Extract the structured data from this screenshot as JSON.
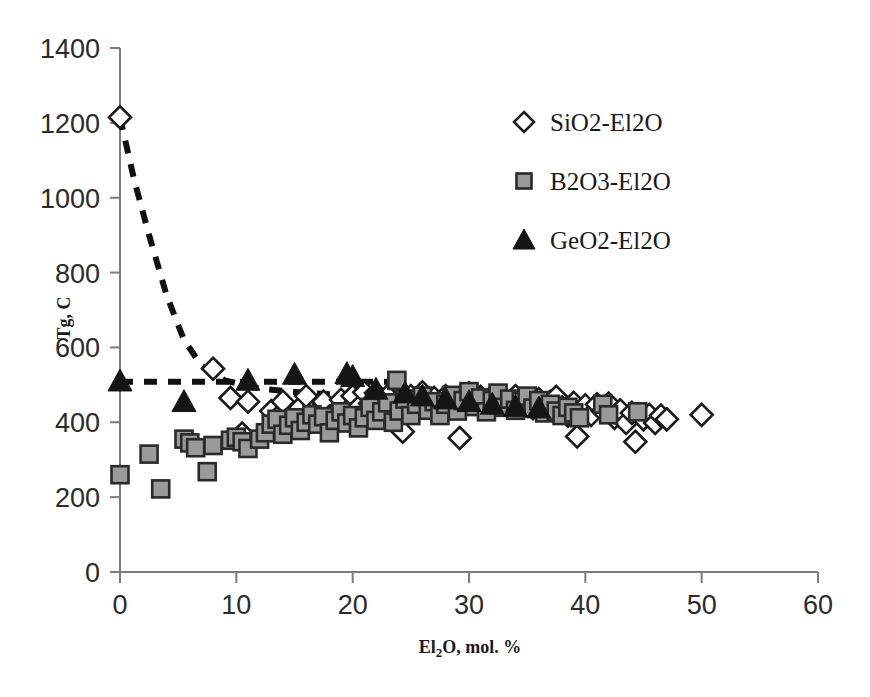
{
  "chart_data": {
    "type": "scatter",
    "title": "",
    "xlabel": "El2O, mol. %",
    "xlabel_parts": {
      "pre": "El",
      "sub": "2",
      "post": "O, mol. %"
    },
    "ylabel": "Tg, C",
    "xlim": [
      0,
      60
    ],
    "ylim": [
      0,
      1400
    ],
    "xticks": [
      "0",
      "10",
      "20",
      "30",
      "40",
      "50",
      "60"
    ],
    "yticks": [
      "0",
      "200",
      "400",
      "600",
      "800",
      "1000",
      "1200",
      "1400"
    ],
    "xtick_step": 10,
    "ytick_step": 200,
    "grid": false,
    "legend_position": "upper-right",
    "colors": {
      "diamond_fill": "#ffffff",
      "diamond_stroke": "#1a1a1a",
      "square_fill": "#9a9a9a",
      "square_stroke": "#2a2a2a",
      "triangle_fill": "#151515",
      "axis": "#7b7b7b",
      "trendline": "#111111",
      "background": "#ffffff"
    },
    "series": [
      {
        "name": "SiO2-El2O",
        "marker": "diamond-open",
        "points": [
          [
            0,
            1215
          ],
          [
            8,
            543
          ],
          [
            9.5,
            465
          ],
          [
            11,
            455
          ],
          [
            10.5,
            370
          ],
          [
            13,
            430
          ],
          [
            13.5,
            412
          ],
          [
            14,
            455
          ],
          [
            15,
            400
          ],
          [
            15.5,
            440
          ],
          [
            16,
            470
          ],
          [
            17,
            430
          ],
          [
            17.5,
            455
          ],
          [
            18,
            415
          ],
          [
            19,
            460
          ],
          [
            19.5,
            430
          ],
          [
            20,
            470
          ],
          [
            20.5,
            440
          ],
          [
            21,
            480
          ],
          [
            21.5,
            450
          ],
          [
            22,
            478
          ],
          [
            22.5,
            455
          ],
          [
            23,
            470
          ],
          [
            23.5,
            440
          ],
          [
            24,
            462
          ],
          [
            24.3,
            375
          ],
          [
            25,
            470
          ],
          [
            25.5,
            455
          ],
          [
            26,
            480
          ],
          [
            26.5,
            445
          ],
          [
            27,
            465
          ],
          [
            27.5,
            440
          ],
          [
            28,
            470
          ],
          [
            28.5,
            452
          ],
          [
            29,
            460
          ],
          [
            29.2,
            358
          ],
          [
            30,
            478
          ],
          [
            30.5,
            450
          ],
          [
            31,
            468
          ],
          [
            31.5,
            442
          ],
          [
            32,
            470
          ],
          [
            32.5,
            448
          ],
          [
            33,
            462
          ],
          [
            33.5,
            440
          ],
          [
            34,
            470
          ],
          [
            34.5,
            448
          ],
          [
            35,
            460
          ],
          [
            35.5,
            438
          ],
          [
            36,
            462
          ],
          [
            36.5,
            448
          ],
          [
            37,
            455
          ],
          [
            37.5,
            468
          ],
          [
            38,
            440
          ],
          [
            38.5,
            418
          ],
          [
            39,
            452
          ],
          [
            39.3,
            362
          ],
          [
            40,
            445
          ],
          [
            40.5,
            420
          ],
          [
            41,
            448
          ],
          [
            41.5,
            430
          ],
          [
            42,
            450
          ],
          [
            42.5,
            412
          ],
          [
            43,
            432
          ],
          [
            43.5,
            398
          ],
          [
            44,
            425
          ],
          [
            44.3,
            348
          ],
          [
            45,
            408
          ],
          [
            45.5,
            420
          ],
          [
            46,
            398
          ],
          [
            46.5,
            418
          ],
          [
            47,
            408
          ],
          [
            50,
            420
          ]
        ]
      },
      {
        "name": "B2O3-El2O",
        "marker": "square-filled",
        "points": [
          [
            0,
            260
          ],
          [
            2.5,
            315
          ],
          [
            3.5,
            222
          ],
          [
            5.5,
            355
          ],
          [
            6,
            345
          ],
          [
            6.5,
            332
          ],
          [
            7.5,
            268
          ],
          [
            8,
            338
          ],
          [
            9.5,
            352
          ],
          [
            10,
            360
          ],
          [
            10.5,
            348
          ],
          [
            11,
            330
          ],
          [
            12,
            355
          ],
          [
            12.5,
            372
          ],
          [
            13,
            395
          ],
          [
            13.5,
            408
          ],
          [
            14,
            368
          ],
          [
            14.5,
            392
          ],
          [
            15,
            412
          ],
          [
            15.5,
            378
          ],
          [
            16,
            400
          ],
          [
            16.5,
            420
          ],
          [
            17,
            395
          ],
          [
            17.5,
            415
          ],
          [
            18,
            372
          ],
          [
            18.5,
            405
          ],
          [
            19,
            428
          ],
          [
            19.5,
            398
          ],
          [
            20,
            418
          ],
          [
            20.5,
            385
          ],
          [
            21,
            412
          ],
          [
            21.5,
            440
          ],
          [
            22,
            405
          ],
          [
            22.5,
            428
          ],
          [
            23,
            452
          ],
          [
            23.5,
            400
          ],
          [
            23.8,
            512
          ],
          [
            24,
            430
          ],
          [
            24.5,
            462
          ],
          [
            25,
            418
          ],
          [
            25.5,
            448
          ],
          [
            26,
            470
          ],
          [
            26.5,
            432
          ],
          [
            27,
            455
          ],
          [
            27.5,
            418
          ],
          [
            28,
            448
          ],
          [
            28.5,
            472
          ],
          [
            29,
            430
          ],
          [
            29.5,
            458
          ],
          [
            30,
            482
          ],
          [
            30.5,
            442
          ],
          [
            31,
            465
          ],
          [
            31.5,
            428
          ],
          [
            32,
            458
          ],
          [
            32.5,
            478
          ],
          [
            33,
            440
          ],
          [
            33.5,
            462
          ],
          [
            34,
            432
          ],
          [
            34.5,
            455
          ],
          [
            35,
            470
          ],
          [
            35.5,
            438
          ],
          [
            36,
            458
          ],
          [
            36.5,
            425
          ],
          [
            37,
            448
          ],
          [
            37.5,
            430
          ],
          [
            38,
            418
          ],
          [
            38.5,
            440
          ],
          [
            39,
            425
          ],
          [
            39.5,
            412
          ],
          [
            41.5,
            448
          ],
          [
            42,
            420
          ],
          [
            44.5,
            428
          ]
        ]
      },
      {
        "name": "GeO2-El2O",
        "marker": "triangle-filled",
        "points": [
          [
            0,
            510
          ],
          [
            5.5,
            455
          ],
          [
            11,
            512
          ],
          [
            15,
            528
          ],
          [
            19.5,
            530
          ],
          [
            20,
            522
          ],
          [
            22,
            488
          ],
          [
            24.5,
            478
          ],
          [
            26,
            470
          ],
          [
            28,
            462
          ],
          [
            30,
            455
          ],
          [
            32,
            448
          ],
          [
            34,
            442
          ],
          [
            36,
            438
          ]
        ]
      }
    ],
    "trendlines": [
      {
        "name": "SiO2-trend",
        "style": "dashed",
        "points": [
          [
            0,
            1215
          ],
          [
            1.2,
            1050
          ],
          [
            2.5,
            900
          ],
          [
            4,
            740
          ],
          [
            5.5,
            620
          ],
          [
            7,
            552
          ],
          [
            9,
            512
          ],
          [
            12,
            490
          ],
          [
            16,
            478
          ],
          [
            20,
            472
          ]
        ]
      },
      {
        "name": "GeO2-trend",
        "style": "dashed",
        "points": [
          [
            0,
            508
          ],
          [
            23,
            508
          ]
        ]
      }
    ]
  },
  "legend": {
    "items": [
      {
        "label": "SiO2-El2O",
        "marker": "diamond-open"
      },
      {
        "label": "B2O3-El2O",
        "marker": "square-filled"
      },
      {
        "label": "GeO2-El2O",
        "marker": "triangle-filled"
      }
    ]
  }
}
